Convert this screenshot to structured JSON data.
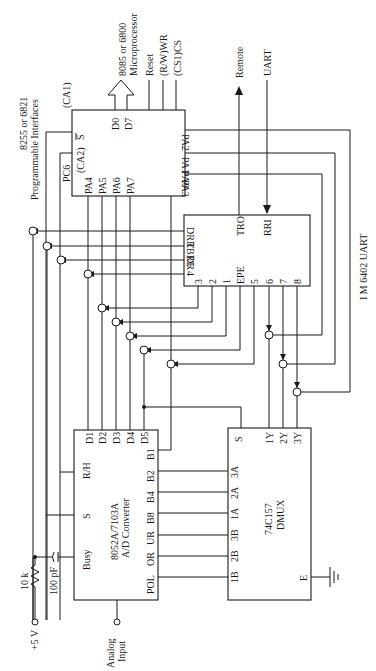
{
  "figure": {
    "orientation": "rotated 90deg clockwise (text reads bottom-to-top)",
    "blocks": {
      "pia": {
        "label_line1": "8255 or 6821",
        "label_line2": "Programmable Interfaces",
        "pins": {
          "ca1": "(CA1)",
          "s_bar": "S",
          "ca2": "(CA2)",
          "pc6": "PC6",
          "pa4": "PA4",
          "pa5": "PA5",
          "pa6": "PA6",
          "pa7": "PA7",
          "d0": "D0",
          "d7": "D7",
          "pa2": "PA2",
          "pa1": "PA1",
          "pa0": "PA0",
          "pa3": "PA3"
        }
      },
      "microprocessor": {
        "label_line1": "8085 or 6800",
        "label_line2": "Microprocessor",
        "signals": [
          "Reset",
          "(R/W)WR",
          "(CS1)CS"
        ]
      },
      "uart": {
        "label": "I M 6402 UART",
        "pins": {
          "drr": "DRR",
          "tbrl": "TBRL",
          "dr": "DR",
          "p4": "4",
          "p3": "3",
          "p2": "2",
          "p1": "1",
          "epe": "EPE",
          "p5": "5",
          "p6": "6",
          "p7": "7",
          "p8": "8",
          "tro": "TRO",
          "rri": "RRI"
        },
        "external": {
          "remote": "Remote",
          "uart": "UART"
        }
      },
      "adc": {
        "label_line1": "8052A/7103A",
        "label_line2": "A/D Converter",
        "pins": {
          "busy": "Busy",
          "s": "S",
          "rh": "R/H",
          "d1": "D1",
          "d2": "D2",
          "d3": "D3",
          "d4": "D4",
          "d5": "D5",
          "b1": "B1",
          "b2": "B2",
          "b4": "B4",
          "b8": "B8",
          "ur": "UR",
          "or": "OR",
          "pol": "POL"
        }
      },
      "dmux": {
        "label_line1": "74C157",
        "label_line2": "DMUX",
        "pins": {
          "s": "S",
          "y1": "1Y",
          "y2": "2Y",
          "y3": "3Y",
          "a3": "3A",
          "a2": "2A",
          "a1": "1A",
          "b3": "3B",
          "b2": "2B",
          "b1": "1B",
          "e": "E"
        }
      },
      "passives": {
        "resistor": "10 k",
        "supply": "+5 V",
        "capacitor": "100 pF",
        "analog_l1": "Analog",
        "analog_l2": "Input"
      }
    }
  }
}
